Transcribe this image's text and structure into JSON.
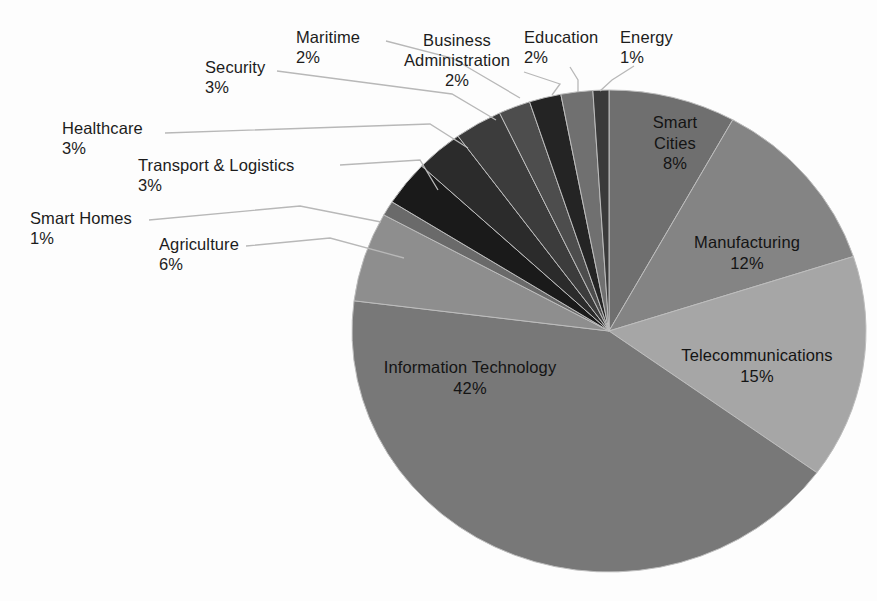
{
  "chart_data": {
    "type": "pie",
    "title": "",
    "subtitle": "",
    "xlabel": "",
    "ylabel": "",
    "legend_position": "none",
    "grid": false,
    "units": "percent",
    "total": 100,
    "categories": [
      "Smart Cities",
      "Manufacturing",
      "Telecommunications",
      "Information Technology",
      "Agriculture",
      "Smart Homes",
      "Transport & Logistics",
      "Healthcare",
      "Security",
      "Maritime",
      "Business Administration",
      "Education",
      "Energy"
    ],
    "values": [
      8,
      12,
      15,
      42,
      6,
      1,
      3,
      3,
      3,
      2,
      2,
      2,
      1
    ],
    "slices": [
      {
        "name": "Smart Cities",
        "label": "Smart Cities",
        "value": 8,
        "pct_text": "8%",
        "color": "#6f6f6f",
        "label_placement": "inside",
        "label_lines": [
          "Smart",
          "Cities"
        ],
        "label_x": 675,
        "label_y": 112,
        "text_color": "#141414"
      },
      {
        "name": "Manufacturing",
        "label": "Manufacturing",
        "value": 12,
        "pct_text": "12%",
        "color": "#848484",
        "label_placement": "inside",
        "label_lines": [
          "Manufacturing"
        ],
        "label_x": 747,
        "label_y": 232,
        "text_color": "#141414"
      },
      {
        "name": "Telecommunications",
        "label": "Telecommunications",
        "value": 15,
        "pct_text": "15%",
        "color": "#a6a6a6",
        "label_placement": "inside",
        "label_lines": [
          "Telecommunications"
        ],
        "label_x": 757,
        "label_y": 345,
        "text_color": "#141414"
      },
      {
        "name": "Information Technology",
        "label": "Information Technology",
        "value": 42,
        "pct_text": "42%",
        "color": "#787878",
        "label_placement": "inside",
        "label_lines": [
          "Information Technology"
        ],
        "label_x": 470,
        "label_y": 357,
        "text_color": "#141414"
      },
      {
        "name": "Agriculture",
        "label": "Agriculture",
        "value": 6,
        "pct_text": "6%",
        "color": "#8e8e8e",
        "label_placement": "callout",
        "label_x": 159,
        "label_y": 234,
        "leader": [
          [
            246,
            246
          ],
          [
            330,
            238
          ],
          [
            404,
            258
          ]
        ]
      },
      {
        "name": "Smart Homes",
        "label": "Smart Homes",
        "value": 1,
        "pct_text": "1%",
        "color": "#6a6a6a",
        "label_placement": "callout",
        "label_x": 30,
        "label_y": 208,
        "leader": [
          [
            149,
            220
          ],
          [
            300,
            206
          ],
          [
            381,
            222
          ]
        ]
      },
      {
        "name": "Transport & Logistics",
        "label": "Transport & Logistics",
        "value": 3,
        "pct_text": "3%",
        "color": "#1a1a1a",
        "label_placement": "callout",
        "label_x": 138,
        "label_y": 155,
        "leader": [
          [
            340,
            165
          ],
          [
            420,
            160
          ],
          [
            438,
            190
          ]
        ]
      },
      {
        "name": "Healthcare",
        "label": "Healthcare",
        "value": 3,
        "pct_text": "3%",
        "color": "#2b2b2b",
        "label_placement": "callout",
        "label_x": 62,
        "label_y": 118,
        "leader": [
          [
            165,
            133
          ],
          [
            430,
            124
          ],
          [
            468,
            148
          ]
        ]
      },
      {
        "name": "Security",
        "label": "Security",
        "value": 3,
        "pct_text": "3%",
        "color": "#3c3c3c",
        "label_placement": "callout",
        "label_x": 205,
        "label_y": 57,
        "leader": [
          [
            277,
            71
          ],
          [
            452,
            94
          ],
          [
            496,
            120
          ]
        ]
      },
      {
        "name": "Maritime",
        "label": "Maritime",
        "value": 2,
        "pct_text": "2%",
        "color": "#4d4d4d",
        "label_placement": "callout",
        "label_x": 296,
        "label_y": 27,
        "leader": [
          [
            386,
            41
          ],
          [
            452,
            58
          ],
          [
            520,
            98
          ]
        ]
      },
      {
        "name": "Business Administration",
        "label": "Business Administration",
        "value": 2,
        "pct_text": "2%",
        "color": "#242424",
        "label_placement": "callout",
        "label_lines": [
          "Business",
          "Administration"
        ],
        "label_x": 404,
        "label_y": 30,
        "leader": [
          [
            524,
            72
          ],
          [
            560,
            84
          ],
          [
            552,
            95
          ]
        ]
      },
      {
        "name": "Education",
        "label": "Education",
        "value": 2,
        "pct_text": "2%",
        "color": "#707070",
        "label_placement": "callout",
        "label_x": 524,
        "label_y": 27,
        "leader": [
          [
            570,
            67
          ],
          [
            578,
            80
          ],
          [
            578,
            92
          ]
        ]
      },
      {
        "name": "Energy",
        "label": "Energy",
        "value": 1,
        "pct_text": "1%",
        "color": "#3a3a3a",
        "label_placement": "callout",
        "label_x": 620,
        "label_y": 27,
        "leader": [
          [
            634,
            66
          ],
          [
            612,
            80
          ],
          [
            600,
            91
          ]
        ]
      }
    ],
    "geometry": {
      "center_x": 609,
      "center_y": 331,
      "radius_x": 257,
      "radius_y": 241,
      "start_angle_deg": -90,
      "direction": "clockwise"
    },
    "style": {
      "background": "#fdfdfd",
      "leader_line_color": "#b8b8b8",
      "label_text_color": "#1c1c1c",
      "slice_stroke": "#bdbdbd"
    }
  }
}
